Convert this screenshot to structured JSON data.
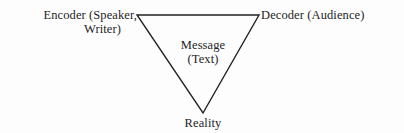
{
  "diagram": {
    "type": "triangle",
    "orientation": "inverted",
    "line_color": "#222222",
    "vertices": {
      "top_left": {
        "label_line1": "Encoder (Speaker,",
        "label_line2": "Writer)"
      },
      "top_right": {
        "label": "Decoder (Audience)"
      },
      "bottom": {
        "label": "Reality"
      }
    },
    "center": {
      "line1": "Message",
      "line2": "(Text)"
    }
  }
}
